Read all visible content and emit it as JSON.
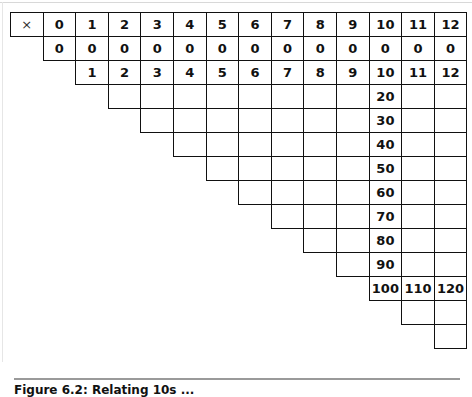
{
  "table": {
    "title": "Multiplication table (upper-triangular, partially filled)",
    "corner_symbol": "×",
    "header": [
      "0",
      "1",
      "2",
      "3",
      "4",
      "5",
      "6",
      "7",
      "8",
      "9",
      "10",
      "11",
      "12"
    ],
    "rows": [
      {
        "multiplier": "0",
        "start_col": 0,
        "values": [
          "0",
          "0",
          "0",
          "0",
          "0",
          "0",
          "0",
          "0",
          "0",
          "0",
          "0",
          "0",
          "0"
        ]
      },
      {
        "multiplier": "1",
        "start_col": 1,
        "values": [
          "1",
          "2",
          "3",
          "4",
          "5",
          "6",
          "7",
          "8",
          "9",
          "10",
          "11",
          "12"
        ]
      },
      {
        "multiplier": "2",
        "start_col": 2,
        "values": [
          "",
          "",
          "",
          "",
          "",
          "",
          "",
          "",
          "20",
          "",
          ""
        ]
      },
      {
        "multiplier": "3",
        "start_col": 3,
        "values": [
          "",
          "",
          "",
          "",
          "",
          "",
          "",
          "30",
          "",
          ""
        ]
      },
      {
        "multiplier": "4",
        "start_col": 4,
        "values": [
          "",
          "",
          "",
          "",
          "",
          "",
          "40",
          "",
          ""
        ]
      },
      {
        "multiplier": "5",
        "start_col": 5,
        "values": [
          "",
          "",
          "",
          "",
          "",
          "50",
          "",
          ""
        ]
      },
      {
        "multiplier": "6",
        "start_col": 6,
        "values": [
          "",
          "",
          "",
          "",
          "60",
          "",
          ""
        ]
      },
      {
        "multiplier": "7",
        "start_col": 7,
        "values": [
          "",
          "",
          "",
          "70",
          "",
          ""
        ]
      },
      {
        "multiplier": "8",
        "start_col": 8,
        "values": [
          "",
          "",
          "80",
          "",
          ""
        ]
      },
      {
        "multiplier": "9",
        "start_col": 9,
        "values": [
          "",
          "90",
          "",
          ""
        ]
      },
      {
        "multiplier": "10",
        "start_col": 10,
        "values": [
          "100",
          "110",
          "120"
        ]
      },
      {
        "multiplier": "11",
        "start_col": 11,
        "values": [
          "",
          ""
        ]
      },
      {
        "multiplier": "12",
        "start_col": 12,
        "values": [
          ""
        ]
      }
    ]
  },
  "caption": "Figure 6.2: Relating 10s ..."
}
